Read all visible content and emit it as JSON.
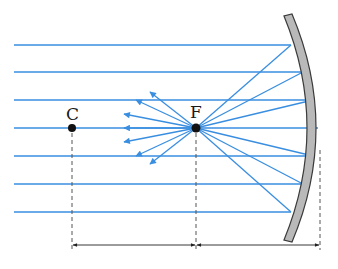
{
  "points": {
    "center": {
      "label": "C",
      "x": 72,
      "y": 128
    },
    "focus": {
      "label": "F",
      "x": 196,
      "y": 128
    }
  },
  "mirror": {
    "vertex_x": 318,
    "top_y": 16,
    "bottom_y": 240,
    "fill": "#b9b9b9",
    "stroke": "#3a3a3a"
  },
  "incident_rays": {
    "color": "#3a8ee0",
    "start_x": 14,
    "rows_y": [
      45,
      72,
      100,
      128,
      156,
      184,
      212
    ],
    "hit_x": [
      291,
      303,
      313,
      318,
      313,
      303,
      291
    ]
  },
  "reflected_arrows": {
    "color": "#3a8ee0",
    "count": 7
  },
  "dimensions": {
    "y": 245,
    "segments": [
      {
        "name": "C-to-F",
        "from_x": 72,
        "to_x": 196
      },
      {
        "name": "F-to-mirror",
        "from_x": 196,
        "to_x": 320
      }
    ],
    "color": "#222222"
  }
}
